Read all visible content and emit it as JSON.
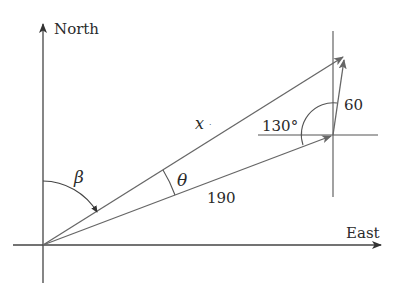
{
  "diagram": {
    "type": "vector-navigation",
    "axes": {
      "north_label": "North",
      "east_label": "East"
    },
    "vectors": {
      "first_leg": {
        "label": "190",
        "magnitude": 190
      },
      "second_leg": {
        "label": "60",
        "magnitude": 60
      },
      "resultant": {
        "label": "x"
      }
    },
    "angles": {
      "beta": {
        "label": "β"
      },
      "theta": {
        "label": "θ"
      },
      "between_legs": {
        "label": "130°",
        "value": 130
      }
    },
    "colors": {
      "stroke": "#555555",
      "text": "#2a2a2a",
      "background": "#ffffff"
    }
  }
}
